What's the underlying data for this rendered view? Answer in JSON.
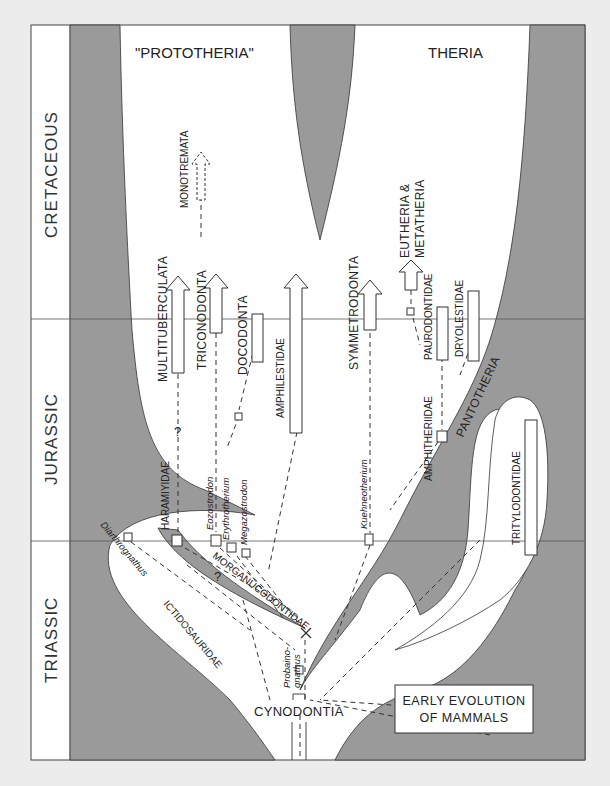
{
  "diagram": {
    "title_lines": [
      "EARLY EVOLUTION",
      "OF MAMMALS"
    ],
    "colors": {
      "background": "#ececec",
      "panel": "#ffffff",
      "shaded_region": "#9a9a9a",
      "line": "#333333"
    },
    "headers": {
      "left": "\"PROTOTHERIA\"",
      "right": "THERIA"
    },
    "periods": [
      {
        "name": "CRETACEOUS"
      },
      {
        "name": "JURASSIC"
      },
      {
        "name": "TRIASSIC"
      }
    ],
    "groups": {
      "monotremata": "MONOTREMATA",
      "multituberculata": "MULTITUBERCULATA",
      "triconodonta": "TRICONODONTA",
      "docodonta": "DOCODONTA",
      "amphilestidae": "AMPHILESTIDAE",
      "symmetrodonta": "SYMMETRODONTA",
      "eutheria_line1": "EUTHERIA &",
      "eutheria_line2": "METATHERIA",
      "paurodontidae": "PAURODONTIDAE",
      "dryolestidae": "DRYOLESTIDAE",
      "pantotheria": "PANTOTHERIA",
      "amphitheriidae": "AMPHITHERIIDAE",
      "tritylodontidae": "TRITYLODONTIDAE",
      "haramiyidae": "HARAMIYIDAE",
      "morganucodontidae": "MORGANUCODONTIDAE",
      "ictidosauridae": "ICTIDOSAURIDAE",
      "cynodontia": "CYNODONTIA"
    },
    "genera": {
      "eozostrodon": "Eozostrodon",
      "erythrotherium": "Erythrotherium",
      "megazostrodon": "Megazostrodon",
      "kuehneotherium": "Kuehneotherium",
      "diarthrognathus": "Diarthrognathus",
      "probainognathus_1": "Probaino-",
      "probainognathus_2": "gnathus"
    },
    "uncertainty_marks": [
      "?",
      "?"
    ]
  }
}
